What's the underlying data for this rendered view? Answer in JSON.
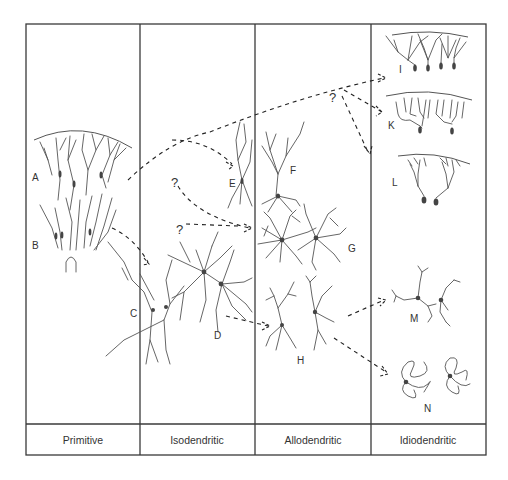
{
  "figure": {
    "categories": [
      {
        "label": "Primitive",
        "neurons": [
          "A",
          "B"
        ]
      },
      {
        "label": "Isodendritic",
        "neurons": [
          "C",
          "D",
          "E"
        ]
      },
      {
        "label": "Allodendritic",
        "neurons": [
          "F",
          "G",
          "H"
        ]
      },
      {
        "label": "Idiodendritic",
        "neurons": [
          "I",
          "K",
          "L",
          "M",
          "N"
        ]
      }
    ],
    "labels": {
      "A": "A",
      "B": "B",
      "C": "C",
      "D": "D",
      "E": "E",
      "F": "F",
      "G": "G",
      "H": "H",
      "I": "I",
      "K": "K",
      "L": "L",
      "M": "M",
      "N": "N"
    },
    "uncertain_marker": "?",
    "colors": {
      "line": "#3a3a3a",
      "dendrite": "#555555",
      "background": "#ffffff"
    }
  }
}
